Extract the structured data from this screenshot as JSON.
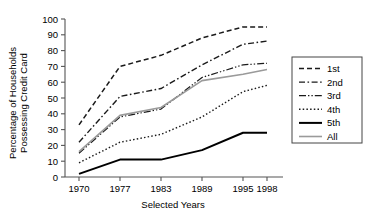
{
  "chart_data": {
    "type": "line",
    "title": "",
    "xlabel": "Selected Years",
    "ylabel": "Percentage of Households Possessing Credit Card",
    "ylabel_line1": "Percentage of Households",
    "ylabel_line2": "Possessing Credit Card",
    "categories": [
      "1970",
      "1977",
      "1983",
      "1989",
      "1995",
      "1998"
    ],
    "x": [
      1970,
      1977,
      1983,
      1989,
      1995,
      1998
    ],
    "ylim": [
      0,
      100
    ],
    "yticks": [
      0,
      10,
      20,
      30,
      40,
      50,
      60,
      70,
      80,
      90,
      100
    ],
    "grid": false,
    "legend_position": "right",
    "series": [
      {
        "name": "1st",
        "values": [
          33,
          70,
          77,
          88,
          95,
          95
        ],
        "style": "dashed",
        "color": "#1a1a1a",
        "dasharray": "5,3",
        "width": 1.5
      },
      {
        "name": "2nd",
        "values": [
          22,
          51,
          56,
          71,
          84,
          86
        ],
        "style": "dash-dot",
        "color": "#1a1a1a",
        "dasharray": "6,2.5,1.6,2.5",
        "width": 1.4
      },
      {
        "name": "3rd",
        "values": [
          15,
          38,
          43,
          63,
          71,
          72
        ],
        "style": "dash-dot-dot",
        "color": "#1a1a1a",
        "dasharray": "7,2,1.4,2,1.4,2",
        "width": 1.2
      },
      {
        "name": "4th",
        "values": [
          9,
          22,
          27,
          38,
          54,
          58
        ],
        "style": "dotted",
        "color": "#1a1a1a",
        "dasharray": "1.5,2.2",
        "width": 1.4
      },
      {
        "name": "5th",
        "values": [
          2,
          11,
          11,
          17,
          28,
          28
        ],
        "style": "solid",
        "color": "#000000",
        "dasharray": "",
        "width": 2.0
      },
      {
        "name": "All",
        "values": [
          16,
          39,
          44,
          61,
          65,
          68
        ],
        "style": "solid",
        "color": "#9a9a9a",
        "dasharray": "",
        "width": 1.6
      }
    ]
  },
  "legend": {
    "items": [
      "1st",
      "2nd",
      "3rd",
      "4th",
      "5th",
      "All"
    ]
  },
  "axes": {
    "y_tick_labels": [
      "100",
      "90",
      "80",
      "70",
      "60",
      "50",
      "40",
      "30",
      "20",
      "10",
      "0"
    ],
    "x_tick_labels": [
      "1970",
      "1977",
      "1983",
      "1989",
      "1995",
      "1998"
    ]
  }
}
